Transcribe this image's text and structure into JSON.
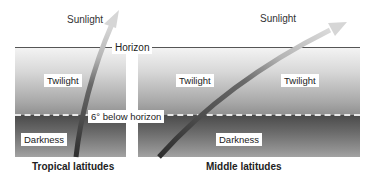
{
  "diagram": {
    "labels": {
      "sunlight_left": "Sunlight",
      "sunlight_right": "Sunlight",
      "horizon": "Horizon",
      "below_horizon": "6° below horizon",
      "twilight_left": "Twilight",
      "twilight_right_a": "Twilight",
      "twilight_right_b": "Twilight",
      "darkness_left": "Darkness",
      "darkness_right": "Darkness"
    },
    "captions": {
      "left": "Tropical latitudes",
      "right": "Middle latitudes"
    },
    "icons": {
      "sun_path_left": "sun-path-arrow-steep",
      "sun_path_right": "sun-path-arrow-shallow"
    },
    "colors": {
      "twilight_top": "#f3f3f3",
      "twilight_bottom": "#909090",
      "darkness_top": "#4a4a4a",
      "darkness_bottom": "#a3a3a3",
      "horizon_line": "#555555",
      "arrow_dark": "#3a3a3a",
      "arrow_light": "#d0d0d0"
    }
  }
}
